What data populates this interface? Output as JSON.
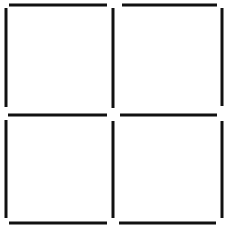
{
  "canvas": {
    "width": 240,
    "height": 234,
    "background": "#ffffff"
  },
  "stroke": {
    "color": "#111111",
    "width": 3
  },
  "grid": {
    "rows": 2,
    "cols": 2,
    "cells": [
      {
        "name": "square-top-left",
        "segments": [
          {
            "side": "top",
            "x1": 9,
            "y1": 5,
            "x2": 107,
            "y2": 5
          },
          {
            "side": "left",
            "x1": 6,
            "y1": 8,
            "x2": 6,
            "y2": 107
          },
          {
            "side": "right",
            "x1": 113,
            "y1": 8,
            "x2": 113,
            "y2": 108
          },
          {
            "side": "bottom",
            "x1": 8,
            "y1": 115,
            "x2": 107,
            "y2": 115
          }
        ]
      },
      {
        "name": "square-top-right",
        "segments": [
          {
            "side": "top",
            "x1": 122,
            "y1": 5,
            "x2": 217,
            "y2": 5
          },
          {
            "side": "right",
            "x1": 222,
            "y1": 8,
            "x2": 222,
            "y2": 106
          },
          {
            "side": "bottom",
            "x1": 120,
            "y1": 115,
            "x2": 217,
            "y2": 115
          }
        ]
      },
      {
        "name": "square-bottom-left",
        "segments": [
          {
            "side": "left",
            "x1": 6,
            "y1": 120,
            "x2": 6,
            "y2": 218
          },
          {
            "side": "right",
            "x1": 113,
            "y1": 121,
            "x2": 113,
            "y2": 218
          },
          {
            "side": "bottom",
            "x1": 9,
            "y1": 223,
            "x2": 107,
            "y2": 223
          }
        ]
      },
      {
        "name": "square-bottom-right",
        "segments": [
          {
            "side": "right",
            "x1": 222,
            "y1": 121,
            "x2": 222,
            "y2": 218
          },
          {
            "side": "bottom",
            "x1": 119,
            "y1": 223,
            "x2": 216,
            "y2": 223
          }
        ]
      }
    ]
  }
}
